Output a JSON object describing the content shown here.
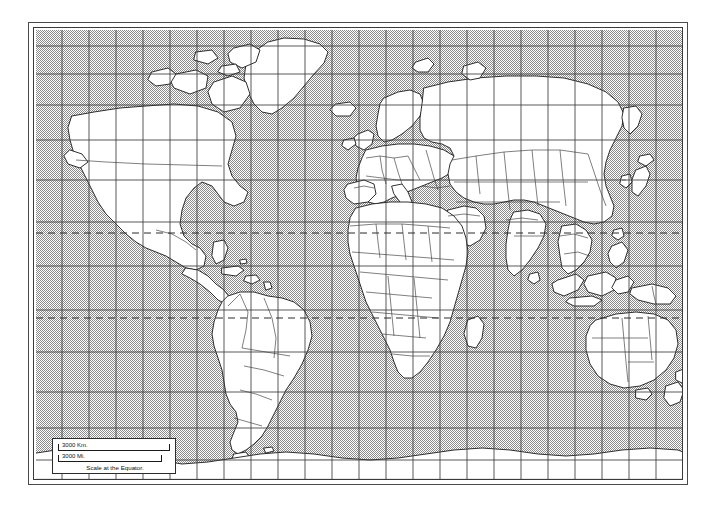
{
  "figure": {
    "projection": "Mercator",
    "background_color": "#ffffff"
  },
  "map": {
    "ocean_color": "#b4b4b4",
    "ocean_fill_style": "halftone-dot-screen",
    "land_color": "#ffffff",
    "coastline_color": "#1a1a1a",
    "border_color": "#3a3a3a",
    "graticule_color": "#404040",
    "tropic_line_style": "dashed",
    "frame_color": "#3a3a3a",
    "graticule_spacing_deg": 15,
    "lon_range": [
      -180,
      180
    ],
    "lat_range": [
      -82,
      83
    ]
  },
  "legend": {
    "km_label": "3000 Km.",
    "mi_label": "3000 Mi.",
    "caption": "Scale at the Equator."
  },
  "annotations": {
    "tropic_of_cancer_lat": 23.5,
    "tropic_of_capricorn_lat": -23.5
  }
}
